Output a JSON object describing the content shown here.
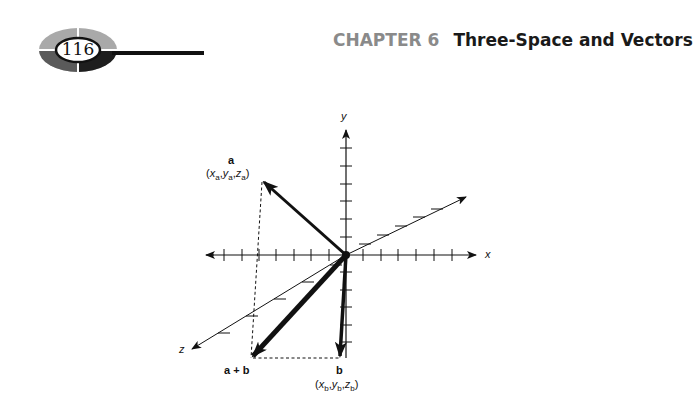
{
  "header": {
    "page_number": "116",
    "chapter_label": "CHAPTER 6",
    "chapter_title": "Three-Space and Vectors"
  },
  "figure": {
    "axes": {
      "x_label": "x",
      "y_label": "y",
      "z_label": "z"
    },
    "vectors": {
      "a": {
        "name": "a",
        "coords_prefix": "(x",
        "coords": "(xa, ya, za)"
      },
      "b": {
        "name": "b",
        "coords": "(xb, yb, zb)"
      },
      "sum": {
        "name": "a + b"
      }
    },
    "label_parts": {
      "a_x": "x",
      "a_y": "y",
      "a_z": "z",
      "a_sub": "a",
      "b_x": "x",
      "b_y": "y",
      "b_z": "z",
      "b_sub": "b",
      "open": "(",
      "close": ")",
      "comma": ","
    },
    "colors": {
      "ink": "#111111",
      "badge_light": "#a8a8a8",
      "badge_dark": "#555555",
      "chapter_gray": "#8a8a8a"
    }
  }
}
